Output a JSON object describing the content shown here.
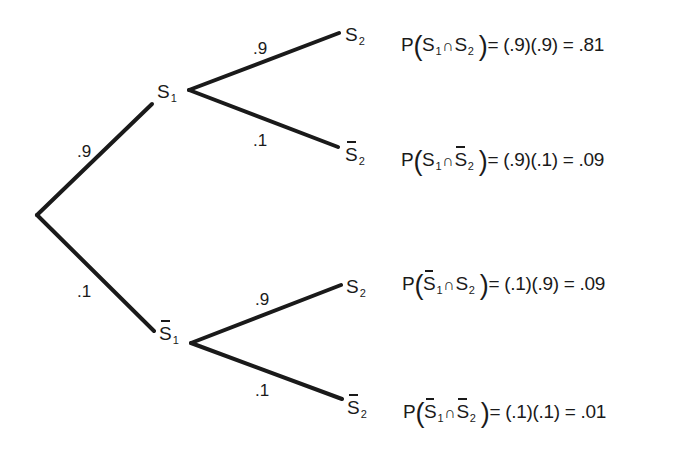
{
  "diagram": {
    "type": "probability-tree",
    "root": {
      "x": 37,
      "y": 215
    },
    "level1": [
      {
        "id": "S1",
        "label": "S",
        "subscript": "1",
        "complement": false,
        "probability": ".9",
        "edge": {
          "x1": 37,
          "y1": 215,
          "x2": 152,
          "y2": 104
        },
        "prob_pos": {
          "x": 77,
          "y": 143
        }
      },
      {
        "id": "notS1",
        "label": "S",
        "subscript": "1",
        "complement": true,
        "probability": ".1",
        "edge": {
          "x1": 37,
          "y1": 215,
          "x2": 154,
          "y2": 331
        },
        "prob_pos": {
          "x": 77,
          "y": 283
        }
      }
    ],
    "level2": [
      {
        "parent": "S1",
        "label": "S",
        "subscript": "2",
        "complement": false,
        "probability": ".9",
        "edge": {
          "x1": 189,
          "y1": 90,
          "x2": 339,
          "y2": 33
        },
        "prob_pos": {
          "x": 253,
          "y": 40
        }
      },
      {
        "parent": "S1",
        "label": "S",
        "subscript": "2",
        "complement": true,
        "probability": ".1",
        "edge": {
          "x1": 189,
          "y1": 90,
          "x2": 338,
          "y2": 147
        },
        "prob_pos": {
          "x": 253,
          "y": 132
        }
      },
      {
        "parent": "notS1",
        "label": "S",
        "subscript": "2",
        "complement": false,
        "probability": ".9",
        "edge": {
          "x1": 191,
          "y1": 343,
          "x2": 341,
          "y2": 285
        },
        "prob_pos": {
          "x": 255,
          "y": 291
        }
      },
      {
        "parent": "notS1",
        "label": "S",
        "subscript": "2",
        "complement": true,
        "probability": ".1",
        "edge": {
          "x1": 191,
          "y1": 343,
          "x2": 342,
          "y2": 399
        },
        "prob_pos": {
          "x": 255,
          "y": 382
        }
      }
    ],
    "outcomes": [
      {
        "lhs_prefix": "P",
        "first": {
          "label": "S",
          "sub": "1",
          "complement": false
        },
        "operator": "∩",
        "second": {
          "label": "S",
          "sub": "2",
          "complement": false
        },
        "rhs": "= (.9)(.9) = .81",
        "value": 0.81
      },
      {
        "lhs_prefix": "P",
        "first": {
          "label": "S",
          "sub": "1",
          "complement": false
        },
        "operator": "∩",
        "second": {
          "label": "S",
          "sub": "2",
          "complement": true
        },
        "rhs": "= (.9)(.1) = .09",
        "value": 0.09
      },
      {
        "lhs_prefix": "P",
        "first": {
          "label": "S",
          "sub": "1",
          "complement": true
        },
        "operator": "∩",
        "second": {
          "label": "S",
          "sub": "2",
          "complement": false
        },
        "rhs": "= (.1)(.9) = .09",
        "value": 0.09
      },
      {
        "lhs_prefix": "P",
        "first": {
          "label": "S",
          "sub": "1",
          "complement": true
        },
        "operator": "∩",
        "second": {
          "label": "S",
          "sub": "2",
          "complement": true
        },
        "rhs": "= (.1)(.1) = .01",
        "value": 0.01
      }
    ]
  },
  "labels": {
    "e1_prob": ".9",
    "e2_prob": ".1",
    "e11_prob": ".9",
    "e12_prob": ".1",
    "e21_prob": ".9",
    "e22_prob": ".1",
    "node_S": "S",
    "sub1": "1",
    "sub2": "2",
    "P": "P",
    "open_paren": "(",
    "close_paren": ")",
    "cap": "∩",
    "rhs1": "= (.9)(.9) = .81",
    "rhs2": "= (.9)(.1) = .09",
    "rhs3": "= (.1)(.9) = .09",
    "rhs4": "= (.1)(.1) = .01"
  },
  "colors": {
    "ink": "#1a1a1a",
    "background": "#ffffff"
  }
}
